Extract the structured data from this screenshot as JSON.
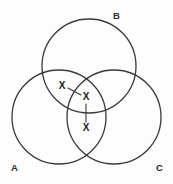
{
  "diagram": {
    "background_color": "#fdfdfd",
    "stroke_color": "#3a3a3a",
    "label_color": "#2b2b2b",
    "sets": [
      {
        "id": "A",
        "label": "A",
        "cx": 59,
        "cy": 117,
        "r": 47,
        "label_x": 11,
        "label_y": 171
      },
      {
        "id": "B",
        "label": "B",
        "cx": 89,
        "cy": 66,
        "r": 47,
        "label_x": 113,
        "label_y": 19
      },
      {
        "id": "C",
        "label": "C",
        "cx": 114,
        "cy": 117,
        "r": 47,
        "label_x": 156,
        "label_y": 171
      }
    ],
    "marks": [
      {
        "id": "mark-ab",
        "text": "X",
        "x": 62,
        "y": 86,
        "region": "A-and-B-only"
      },
      {
        "id": "mark-abc",
        "text": "X",
        "x": 86,
        "y": 97,
        "region": "A-and-B-and-C"
      },
      {
        "id": "mark-ac",
        "text": "X",
        "x": 86,
        "y": 128,
        "region": "A-and-C-only"
      }
    ],
    "leaders": [
      {
        "id": "leader-diagonal",
        "x1": 68,
        "y1": 88,
        "x2": 81,
        "y2": 95
      },
      {
        "id": "leader-vertical",
        "x1": 86,
        "y1": 104,
        "x2": 86,
        "y2": 122
      }
    ]
  }
}
